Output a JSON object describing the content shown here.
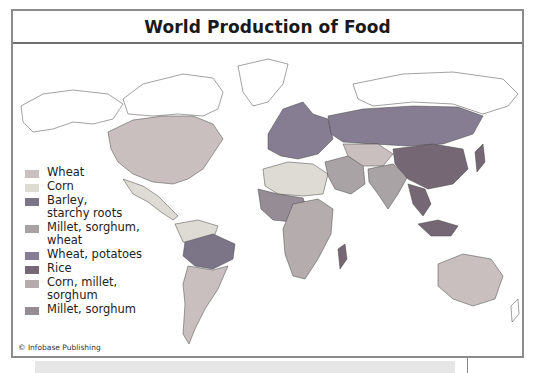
{
  "title": "World Production of Food",
  "credit": "© Infobase Publishing",
  "legend": [
    {
      "key": "wheat",
      "label": "Wheat",
      "color": "#c9bfbf"
    },
    {
      "key": "corn",
      "label": "Corn",
      "color": "#dedad4"
    },
    {
      "key": "barley",
      "label": "Barley,\nstarchy roots",
      "color": "#7c7588"
    },
    {
      "key": "millet_sorghum_wheat",
      "label": "Millet, sorghum,\nwheat",
      "color": "#aaa3a6"
    },
    {
      "key": "wheat_potatoes",
      "label": "Wheat, potatoes",
      "color": "#867d92"
    },
    {
      "key": "rice",
      "label": "Rice",
      "color": "#756874"
    },
    {
      "key": "corn_millet_sorghum",
      "label": "Corn, millet,\nsorghum",
      "color": "#b5acae"
    },
    {
      "key": "millet_sorghum",
      "label": "Millet, sorghum",
      "color": "#958c95"
    }
  ],
  "regions": [
    {
      "name": "north-america",
      "crop": "wheat"
    },
    {
      "name": "mexico-central-america",
      "crop": "corn"
    },
    {
      "name": "northern-south-america",
      "crop": "corn"
    },
    {
      "name": "amazon",
      "crop": "barley"
    },
    {
      "name": "southern-south-america",
      "crop": "wheat"
    },
    {
      "name": "europe",
      "crop": "wheat_potatoes"
    },
    {
      "name": "russia",
      "crop": "wheat_potatoes"
    },
    {
      "name": "north-africa",
      "crop": "corn"
    },
    {
      "name": "west-africa",
      "crop": "millet_sorghum"
    },
    {
      "name": "central-southern-africa",
      "crop": "corn_millet_sorghum"
    },
    {
      "name": "middle-east",
      "crop": "millet_sorghum_wheat"
    },
    {
      "name": "central-asia",
      "crop": "wheat"
    },
    {
      "name": "india",
      "crop": "millet_sorghum_wheat"
    },
    {
      "name": "china",
      "crop": "rice"
    },
    {
      "name": "southeast-asia",
      "crop": "rice"
    },
    {
      "name": "indonesia",
      "crop": "rice"
    },
    {
      "name": "australia",
      "crop": "wheat"
    },
    {
      "name": "madagascar",
      "crop": "rice"
    }
  ]
}
